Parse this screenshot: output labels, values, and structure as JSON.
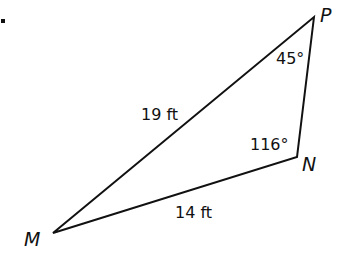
{
  "figure": {
    "bullet": "•",
    "triangle": {
      "vertices": [
        {
          "name": "P",
          "x": 314,
          "y": 17
        },
        {
          "name": "N",
          "x": 297,
          "y": 157
        },
        {
          "name": "M",
          "x": 53,
          "y": 233
        }
      ]
    },
    "vertex_labels": {
      "P": "P",
      "N": "N",
      "M": "M"
    },
    "side_labels": {
      "MP": "19 ft",
      "MN": "14 ft"
    },
    "angle_labels": {
      "P": "45°",
      "N": "116°"
    },
    "colors": {
      "stroke": "#111111",
      "text": "#111111",
      "background": "#ffffff"
    }
  }
}
